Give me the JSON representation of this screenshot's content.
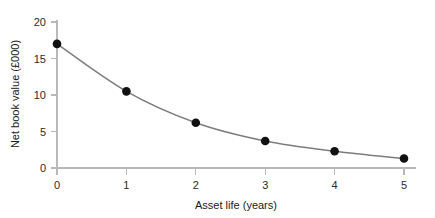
{
  "chart_data": {
    "type": "line",
    "title": "",
    "subtitle": "",
    "xlabel": "Asset life (years)",
    "ylabel": "Net book value (£000)",
    "x": [
      0,
      1,
      2,
      3,
      4,
      5
    ],
    "values": [
      17.0,
      10.5,
      6.2,
      3.7,
      2.3,
      1.3
    ],
    "series": [
      {
        "name": "Net book value",
        "values": [
          17.0,
          10.5,
          6.2,
          3.7,
          2.3,
          1.3
        ]
      }
    ],
    "xlim": [
      0,
      5
    ],
    "ylim": [
      0,
      20
    ],
    "xticks": [
      0,
      1,
      2,
      3,
      4,
      5
    ],
    "yticks": [
      0,
      5,
      10,
      15,
      20
    ],
    "xtick_labels": [
      "0",
      "1",
      "2",
      "3",
      "4",
      "5"
    ],
    "ytick_labels": [
      "0",
      "5",
      "10",
      "15",
      "20"
    ],
    "grid": false,
    "legend": false,
    "legend_position": "none",
    "marker": "circle",
    "marker_color": "#111111",
    "line_color": "#7d7d7d",
    "axis_color": "#b9b9b9",
    "background_color": "#ffffff",
    "annotations": []
  }
}
